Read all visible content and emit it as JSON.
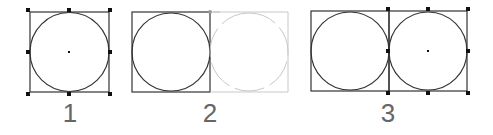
{
  "panels": [
    {
      "label": "1",
      "description": "selected circle inside square with 8 handles"
    },
    {
      "label": "2",
      "description": "dragging duplicate (ghost) to the right"
    },
    {
      "label": "3",
      "description": "two circles in squares side by side, right one selected"
    }
  ],
  "colors": {
    "stroke": "#333333",
    "ghost": "#c8c8c8",
    "label": "#666666",
    "handle": "#111111"
  }
}
